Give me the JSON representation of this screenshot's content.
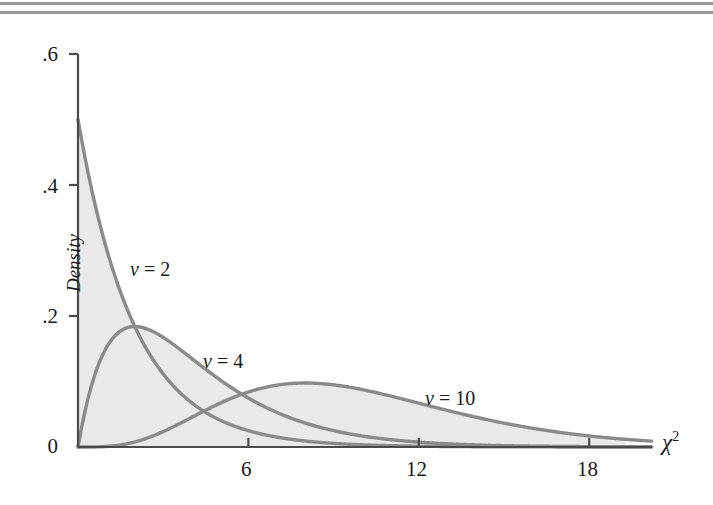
{
  "decorations": {
    "rule_top": "horizontal-rule",
    "rule_bottom": "horizontal-rule",
    "rule_color": "#9a9a9a"
  },
  "chart_data": {
    "type": "line",
    "title": "",
    "subtitle": "",
    "xlabel": "χ²",
    "xlabel_base": "χ",
    "xlabel_sup": "2",
    "ylabel": "Density",
    "xlim": [
      0,
      20.2
    ],
    "ylim": [
      0,
      0.6
    ],
    "xticks": [
      6,
      12,
      18
    ],
    "xtick_labels": [
      "6",
      "12",
      "18"
    ],
    "yticks": [
      0,
      0.2,
      0.4,
      0.6
    ],
    "ytick_labels": [
      "0",
      ".2",
      ".4",
      ".6"
    ],
    "grid": false,
    "legend": "inline-annotations",
    "fill": "shaded-area-under-curves",
    "fill_color": "#e9e9e9",
    "curve_color": "#8a8a8a",
    "axis_color": "#4a4a4a",
    "annotations": [
      {
        "text": "v = 2",
        "var": "v",
        "value": 2,
        "x_px": 130,
        "y_px": 238
      },
      {
        "text": "v = 4",
        "var": "v",
        "value": 4,
        "x_px": 203,
        "y_px": 330
      },
      {
        "text": "v = 10",
        "var": "v",
        "value": 10,
        "x_px": 425,
        "y_px": 367
      }
    ],
    "series": [
      {
        "name": "v = 2",
        "df": 2,
        "x": [
          0,
          0.25,
          0.5,
          0.75,
          1,
          1.5,
          2,
          2.5,
          3,
          3.5,
          4,
          5,
          6,
          7,
          8,
          9,
          10,
          11,
          12,
          14,
          16,
          18,
          20
        ],
        "values": [
          0.5,
          0.4412,
          0.3894,
          0.3436,
          0.3033,
          0.2362,
          0.1839,
          0.1433,
          0.1116,
          0.0869,
          0.0677,
          0.041,
          0.0249,
          0.0151,
          0.0092,
          0.0056,
          0.0034,
          0.002,
          0.0012,
          0.0005,
          0.0002,
          0.0001,
          5e-05
        ]
      },
      {
        "name": "v = 4",
        "df": 4,
        "x": [
          0,
          0.5,
          1,
          1.5,
          2,
          2.5,
          3,
          3.5,
          4,
          5,
          6,
          7,
          8,
          9,
          10,
          11,
          12,
          14,
          16,
          18,
          20
        ],
        "values": [
          0,
          0.0973,
          0.1516,
          0.1771,
          0.1839,
          0.1791,
          0.1673,
          0.1521,
          0.1353,
          0.1026,
          0.0747,
          0.0529,
          0.0366,
          0.025,
          0.0168,
          0.0112,
          0.0074,
          0.0032,
          0.0013,
          0.0005,
          0.0002
        ]
      },
      {
        "name": "v = 10",
        "df": 10,
        "x": [
          0,
          1,
          2,
          3,
          4,
          5,
          6,
          7,
          8,
          9,
          10,
          11,
          12,
          13,
          14,
          15,
          16,
          17,
          18,
          19,
          20
        ],
        "values": [
          0,
          0.0016,
          0.0077,
          0.0187,
          0.0326,
          0.0467,
          0.0594,
          0.0694,
          0.0757,
          0.0786,
          0.0752,
          0.0711,
          0.0652,
          0.0585,
          0.0516,
          0.0447,
          0.0383,
          0.0324,
          0.0271,
          0.0225,
          0.0186
        ]
      }
    ]
  }
}
